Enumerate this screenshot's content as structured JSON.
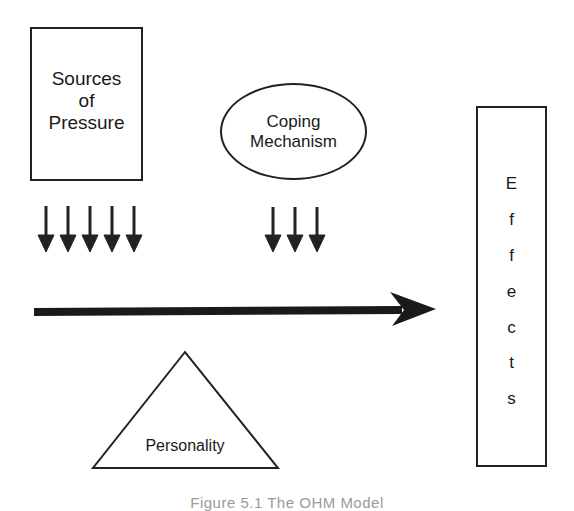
{
  "diagram": {
    "sources_label": "Sources\nof\nPressure",
    "coping_label": "Coping\nMechanism",
    "personality_label": "Personality",
    "effects_letters": [
      "E",
      "f",
      "f",
      "e",
      "c",
      "t",
      "s"
    ],
    "effects_label": "Effects",
    "sources_arrow_count": 5,
    "coping_arrow_count": 3,
    "caption": "Figure 5.1   The OHM Model"
  },
  "colors": {
    "stroke": "#222222",
    "background": "#ffffff",
    "caption": "#9a9a9a"
  }
}
